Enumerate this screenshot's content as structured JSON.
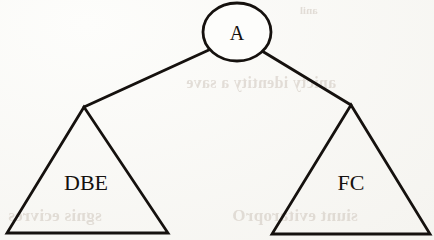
{
  "figure": {
    "kind": "tree-diagram",
    "caption": "",
    "background_color": "#fdfdfb",
    "ink_color": "#15110e"
  },
  "nodes": {
    "root": {
      "label": "A",
      "shape": "ellipse",
      "cx": 237,
      "cy": 32,
      "rx": 34,
      "ry": 29,
      "label_x": 237,
      "label_y": 40,
      "label_size": 20
    },
    "left_subtree": {
      "label": "DBE",
      "shape": "triangle",
      "apex_x": 84,
      "apex_y": 107,
      "base_left_x": 7,
      "base_left_y": 233,
      "base_right_x": 168,
      "base_right_y": 233,
      "label_x": 86,
      "label_y": 190,
      "label_size": 22
    },
    "right_subtree": {
      "label": "FC",
      "shape": "triangle",
      "apex_x": 351,
      "apex_y": 105,
      "base_left_x": 272,
      "base_left_y": 234,
      "base_right_x": 430,
      "base_right_y": 234,
      "label_x": 351,
      "label_y": 190,
      "label_size": 22
    }
  },
  "edges": [
    {
      "name": "edge-root-to-left",
      "from": "root",
      "to": "left_subtree",
      "x1": 211,
      "y1": 49,
      "x2": 84,
      "y2": 107
    },
    {
      "name": "edge-root-to-right",
      "from": "root",
      "to": "right_subtree",
      "x1": 262,
      "y1": 51,
      "x2": 351,
      "y2": 105
    }
  ],
  "ghost_text": {
    "middle": "anicty identity a save",
    "bottom_left": "sgnis ecivres",
    "bottom_right": "siunt evitaroprO",
    "top_right": "anil"
  },
  "stroke": {
    "edge_width": 3.0,
    "outline_width": 2.8
  }
}
